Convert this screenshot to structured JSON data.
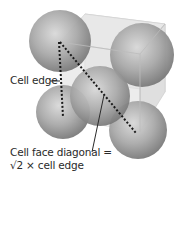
{
  "diagram": {
    "type": "face-centered cubic unit cell",
    "labels": {
      "cell_edge": "Cell edge",
      "face_diagonal_line1": "Cell face diagonal =",
      "face_diagonal_line2": "√2 × cell edge"
    },
    "spheres": [
      {
        "name": "top-left",
        "cx": 60,
        "cy": 41,
        "r": 31
      },
      {
        "name": "top-right",
        "cx": 142,
        "cy": 55,
        "r": 32
      },
      {
        "name": "center-face",
        "cx": 100,
        "cy": 96,
        "r": 30
      },
      {
        "name": "bottom-left",
        "cx": 63,
        "cy": 112,
        "r": 27
      },
      {
        "name": "bottom-right",
        "cx": 138,
        "cy": 130,
        "r": 29
      }
    ],
    "colors": {
      "sphere_light": "#d6d6d6",
      "sphere_dark": "#7a7a7a",
      "cube": "#e4e4e4",
      "dotted_line": "#1a1a1a",
      "text": "#2a2a2a"
    }
  }
}
